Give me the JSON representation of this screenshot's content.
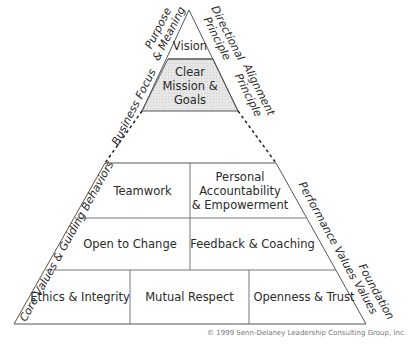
{
  "levels": {
    "vision": "Vision",
    "mission": "Clear\nMission & Goals",
    "performance_values": [
      "Teamwork",
      "Personal\nAccountability\n& Empowerment",
      "Open to Change",
      "Feedback & Coaching"
    ],
    "foundation_values": [
      "Ethics & Integrity",
      "Mutual Respect",
      "Openness & Trust"
    ]
  },
  "side_labels": {
    "purpose": "Purpose\n& Meaning",
    "directional": "Directional\nPrinciple",
    "business_focus": "Business Focus",
    "alignment": "Alignment\nPrinciple",
    "core_values": "Core Values & Guiding Behaviors",
    "performance": "Performance Values",
    "foundation": "Foundation\nValues"
  },
  "copyright": "© 1999 Senn-Delaney Leadership Consulting Group, Inc.",
  "colors": {
    "line": "#555555",
    "mission_fill": "#e2e2e2"
  }
}
